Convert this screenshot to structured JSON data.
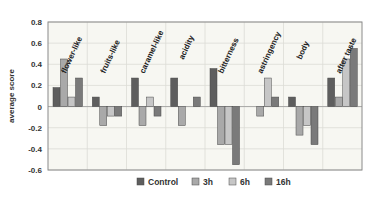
{
  "chart_data": {
    "type": "bar",
    "title": "",
    "xlabel": "",
    "ylabel": "average score",
    "ylim": [
      -0.6,
      0.8
    ],
    "yticks": [
      0.8,
      0.6,
      0.4,
      0.2,
      0,
      -0.2,
      -0.4,
      -0.6
    ],
    "ytick_labels": [
      "0.8",
      "0.6",
      "0.4",
      "0.2",
      "0",
      "-0.2",
      "-0.4",
      "-0.6"
    ],
    "grid": true,
    "legend_position": "bottom",
    "categories": [
      "flower-like",
      "fruits-like",
      "caramel-like",
      "acidity",
      "bitterness",
      "astringency",
      "body",
      "after taste"
    ],
    "series": [
      {
        "name": "Control",
        "color": "#5e5e5e",
        "values": [
          0.18,
          0.09,
          0.27,
          0.27,
          0.36,
          0.0,
          0.09,
          0.27
        ]
      },
      {
        "name": "3h",
        "color": "#a9a9a9",
        "values": [
          0.45,
          -0.18,
          -0.18,
          -0.18,
          -0.36,
          -0.09,
          -0.27,
          0.09
        ]
      },
      {
        "name": "6h",
        "color": "#c6c6c6",
        "values": [
          0.09,
          -0.09,
          0.09,
          0.0,
          -0.36,
          0.27,
          -0.18,
          0.45
        ]
      },
      {
        "name": "16h",
        "color": "#7a7a7a",
        "values": [
          0.27,
          -0.09,
          -0.09,
          0.09,
          -0.55,
          0.09,
          -0.36,
          0.55
        ]
      }
    ]
  }
}
